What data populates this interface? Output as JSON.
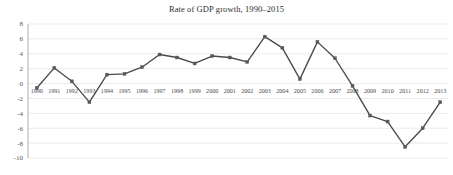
{
  "chart_data": {
    "type": "line",
    "title": "Rate of GDP growth, 1990–2015",
    "xlabel": "",
    "ylabel": "",
    "ylim": [
      -10,
      8
    ],
    "yticks": [
      8,
      6,
      4,
      2,
      0,
      -2,
      -4,
      -6,
      -8,
      -10
    ],
    "grid": true,
    "legend": "none",
    "categories": [
      "1990",
      "1991",
      "1992",
      "1993",
      "1994",
      "1995",
      "1996",
      "1997",
      "1998",
      "1999",
      "2000",
      "2001",
      "2002",
      "2003",
      "2004",
      "2005",
      "2006",
      "2007",
      "2008",
      "2009",
      "2010",
      "2011",
      "2012",
      "2013"
    ],
    "values": [
      -0.6,
      2.1,
      0.3,
      -2.5,
      1.2,
      1.3,
      2.2,
      3.9,
      3.5,
      2.7,
      3.7,
      3.5,
      2.9,
      6.3,
      4.8,
      0.6,
      5.6,
      3.4,
      -0.3,
      -4.3,
      -5.1,
      -8.5,
      -6.0,
      -2.5
    ],
    "series_name": "Rate of GDP growth",
    "markers": true,
    "line_color": "#4a4a4a",
    "marker_color": "#585858",
    "grid_color": "#e2e2e2",
    "axis_color": "#9a9a9a",
    "title_color": "#2f2f2f",
    "background": "#ffffff"
  }
}
